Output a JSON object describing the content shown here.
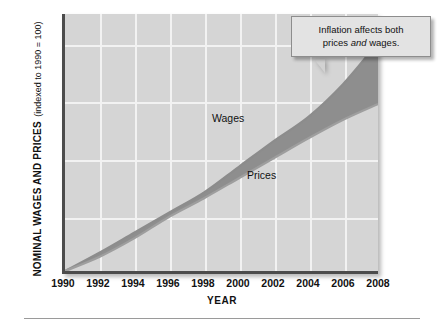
{
  "chart_data": {
    "type": "area",
    "title": "",
    "ylabel_main": "NOMINAL WAGES AND PRICES",
    "ylabel_sub": "(indexed to 1990 = 100)",
    "xlabel": "YEAR",
    "x": [
      1990,
      1992,
      1994,
      1996,
      1998,
      2000,
      2002,
      2004,
      2006,
      2008
    ],
    "xlim": [
      1990,
      2008
    ],
    "ylim": [
      100,
      190
    ],
    "yticks": [
      100,
      120,
      140,
      160,
      180
    ],
    "ytick_labels": [
      "100",
      "120",
      "140",
      "160",
      "180"
    ],
    "xticks": [
      1990,
      1992,
      1994,
      1996,
      1998,
      2000,
      2002,
      2004,
      2006,
      2008
    ],
    "xtick_labels": [
      "1990",
      "1992",
      "1994",
      "1996",
      "1998",
      "2000",
      "2002",
      "2004",
      "2006",
      "2008"
    ],
    "grid": true,
    "legend_position": "inline-annotations",
    "series": [
      {
        "name": "Wages",
        "color": "#8c8c8c",
        "values": [
          100,
          106.5,
          113.5,
          120.5,
          127.5,
          136.5,
          145.5,
          154.0,
          165.5,
          180.0
        ]
      },
      {
        "name": "Prices",
        "color": "#9e9e9e",
        "values": [
          100,
          105.0,
          111.5,
          119.0,
          125.5,
          132.5,
          139.5,
          146.5,
          153.0,
          158.5
        ]
      }
    ],
    "band_fill_color": "#8e8e8e",
    "plot_background": "#d5d5d5",
    "gridline_color": "#f2f2f2",
    "annotations": [
      {
        "name": "Wages",
        "label": "Wages",
        "x": 1999.3,
        "y": 150
      },
      {
        "name": "Prices",
        "label": "Prices",
        "x": 2001.6,
        "y": 136
      }
    ]
  },
  "callout": {
    "line1": "Inflation affects both",
    "line2_before": "prices ",
    "line2_em": "and",
    "line2_after": " wages."
  }
}
